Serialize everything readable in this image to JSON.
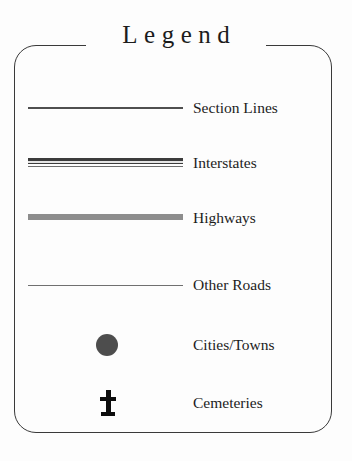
{
  "legend": {
    "title": "Legend",
    "frame": {
      "border_color": "#3a3a3a",
      "corner_radius_px": 22,
      "background": "#fdfdfd"
    },
    "entries": [
      {
        "label": "Section Lines",
        "symbol": "single-line",
        "color": "#4f4f4f"
      },
      {
        "label": "Interstates",
        "symbol": "double-line",
        "color": "#3c3c3c"
      },
      {
        "label": "Highways",
        "symbol": "thick-band",
        "color": "#8d8d8d"
      },
      {
        "label": "Other Roads",
        "symbol": "hairline",
        "color": "#707070"
      },
      {
        "label": "Cities/Towns",
        "symbol": "filled-circle",
        "color": "#4d4d4d"
      },
      {
        "label": "Cemeteries",
        "symbol": "cross",
        "color": "#0d0d0d"
      }
    ]
  },
  "bottom_caption": {
    "text": " "
  }
}
